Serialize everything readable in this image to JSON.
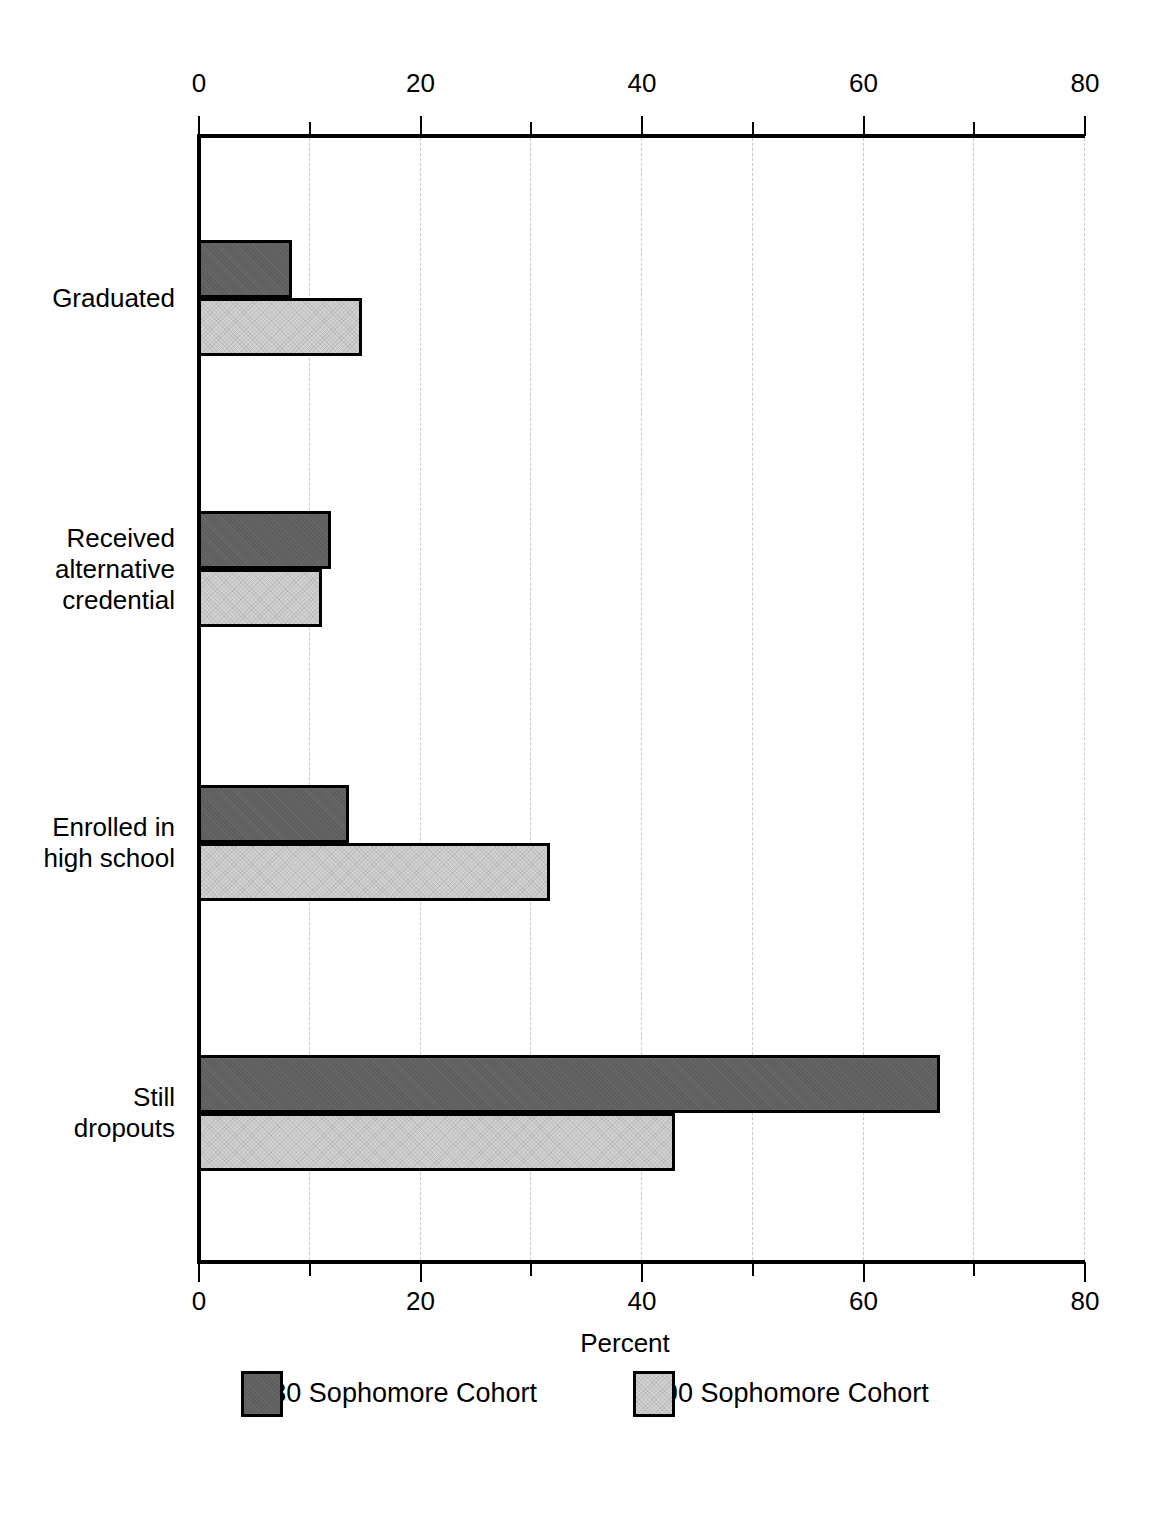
{
  "chart_data": {
    "type": "bar",
    "orientation": "horizontal",
    "title": "",
    "xlabel": "Percent",
    "ylabel": "",
    "xlim": [
      0,
      80
    ],
    "xticks": [
      0,
      20,
      40,
      60,
      80
    ],
    "xminorticks": [
      10,
      30,
      50,
      70
    ],
    "grid": "vertical-dashed-minor",
    "legend_position": "bottom",
    "categories": [
      "Graduated",
      "Received alternative credential",
      "Enrolled in high school",
      "Still dropouts"
    ],
    "category_label_lines": [
      [
        "Graduated"
      ],
      [
        "Received",
        "alternative",
        "credential"
      ],
      [
        "Enrolled in",
        "high school"
      ],
      [
        "Still",
        "dropouts"
      ]
    ],
    "series": [
      {
        "name": "1980 Sophomore Cohort",
        "color": "#5e5e5e",
        "values": [
          8.2,
          11.7,
          13.4,
          66.7
        ]
      },
      {
        "name": "1990 Sophomore Cohort",
        "color": "#d2d2d2",
        "values": [
          14.5,
          10.9,
          31.5,
          42.8
        ]
      }
    ]
  },
  "axis": {
    "top_tick_labels": [
      "0",
      "20",
      "40",
      "60",
      "80"
    ],
    "bottom_tick_labels": [
      "0",
      "20",
      "40",
      "60",
      "80"
    ],
    "x_axis_title": "Percent"
  },
  "legend": {
    "items": [
      {
        "label": "1980 Sophomore Cohort",
        "color": "#5e5e5e"
      },
      {
        "label": "1990 Sophomore Cohort",
        "color": "#d2d2d2"
      }
    ]
  },
  "colors": {
    "cohort_1980": "#5e5e5e",
    "cohort_1990": "#d2d2d2",
    "axis": "#000000",
    "gridline": "#c9c9c9",
    "background": "#ffffff"
  }
}
